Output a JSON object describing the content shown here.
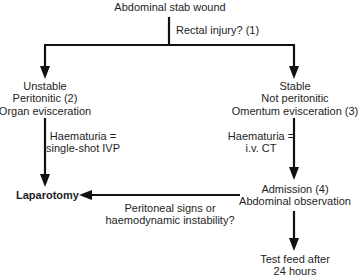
{
  "diagram": {
    "type": "flowchart",
    "start": {
      "label": "Abdominal stab wound"
    },
    "rectal_question": {
      "label": "Rectal injury? (1)"
    },
    "unstable_branch": {
      "lines": [
        "Unstable",
        "Peritonitic (2)",
        "Organ evisceration"
      ]
    },
    "stable_branch": {
      "lines": [
        "Stable",
        "Not peritonitic",
        "Omentum evisceration (3)"
      ]
    },
    "haematuria_unstable": {
      "lines": [
        "Haematuria =",
        "single-shot IVP"
      ]
    },
    "haematuria_stable": {
      "lines": [
        "Haematuria =",
        "i.v. CT"
      ]
    },
    "laparotomy": {
      "label": "Laparotomy"
    },
    "admission": {
      "lines": [
        "Admission (4)",
        "Abdominal observation"
      ]
    },
    "peritoneal_question": {
      "lines": [
        "Peritoneal signs or",
        "haemodynamic instability?"
      ]
    },
    "test_feed": {
      "lines": [
        "Test feed after",
        "24 hours"
      ]
    },
    "edges": [
      {
        "from": "Abdominal stab wound",
        "to": "Unstable / Peritonitic / Organ evisceration",
        "label": "Rectal injury? (1)"
      },
      {
        "from": "Abdominal stab wound",
        "to": "Stable / Not peritonitic / Omentum evisceration",
        "label": "Rectal injury? (1)"
      },
      {
        "from": "Unstable / Peritonitic / Organ evisceration",
        "to": "Laparotomy",
        "label": "Haematuria = single-shot IVP"
      },
      {
        "from": "Stable / Not peritonitic / Omentum evisceration",
        "to": "Admission (4) Abdominal observation",
        "label": "Haematuria = i.v. CT"
      },
      {
        "from": "Admission (4) Abdominal observation",
        "to": "Laparotomy",
        "label": "Peritoneal signs or haemodynamic instability?"
      },
      {
        "from": "Admission (4) Abdominal observation",
        "to": "Test feed after 24 hours",
        "label": ""
      }
    ],
    "colors": {
      "line": "#111111",
      "text": "#1e1e1e",
      "background": "#ffffff"
    }
  }
}
